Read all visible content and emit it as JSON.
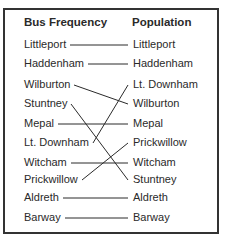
{
  "headers": {
    "left": "Bus Frequency",
    "right": "Population"
  },
  "left_column": [
    "Littleport",
    "Haddenham",
    "Wilburton",
    "Stuntney",
    "Mepal",
    "Lt. Downham",
    "Witcham",
    "Prickwillow",
    "Aldreth",
    "Barway"
  ],
  "right_column": [
    "Littleport",
    "Haddenham",
    "Lt. Downham",
    "Wilburton",
    "Mepal",
    "Prickwillow",
    "Witcham",
    "Stuntney",
    "Aldreth",
    "Barway"
  ],
  "links": [
    {
      "from": "Littleport",
      "to": "Littleport"
    },
    {
      "from": "Haddenham",
      "to": "Haddenham"
    },
    {
      "from": "Wilburton",
      "to": "Wilburton"
    },
    {
      "from": "Stuntney",
      "to": "Stuntney"
    },
    {
      "from": "Mepal",
      "to": "Mepal"
    },
    {
      "from": "Lt. Downham",
      "to": "Lt. Downham"
    },
    {
      "from": "Witcham",
      "to": "Witcham"
    },
    {
      "from": "Prickwillow",
      "to": "Prickwillow"
    },
    {
      "from": "Aldreth",
      "to": "Aldreth"
    },
    {
      "from": "Barway",
      "to": "Barway"
    }
  ],
  "colors": {
    "ink": "#2a2a2a",
    "frame": "#333333",
    "background": "#ffffff"
  }
}
